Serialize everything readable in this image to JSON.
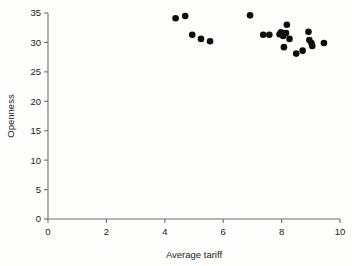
{
  "chart_data": {
    "type": "scatter",
    "title": "",
    "xlabel": "Average tariff",
    "ylabel": "Openness",
    "xlim": [
      0,
      10
    ],
    "ylim": [
      0,
      35
    ],
    "xticks": [
      0,
      2,
      4,
      6,
      8,
      10
    ],
    "yticks": [
      0,
      5,
      10,
      15,
      20,
      25,
      30,
      35
    ],
    "grid": false,
    "legend": null,
    "marker": "filled-circle",
    "marker_color": "#0d0d0d",
    "axis_color": "#6e6e6e",
    "background_color": "#fdfdfb",
    "series": [
      {
        "name": "countries",
        "points": [
          {
            "x": 4.37,
            "y": 34.1
          },
          {
            "x": 4.7,
            "y": 34.5
          },
          {
            "x": 4.94,
            "y": 31.3
          },
          {
            "x": 5.24,
            "y": 30.6
          },
          {
            "x": 5.55,
            "y": 30.2
          },
          {
            "x": 6.92,
            "y": 34.6
          },
          {
            "x": 7.37,
            "y": 31.3
          },
          {
            "x": 7.58,
            "y": 31.3
          },
          {
            "x": 7.93,
            "y": 31.4
          },
          {
            "x": 7.98,
            "y": 31.7
          },
          {
            "x": 8.05,
            "y": 31.1
          },
          {
            "x": 8.08,
            "y": 29.2
          },
          {
            "x": 8.18,
            "y": 33.0
          },
          {
            "x": 8.15,
            "y": 31.6
          },
          {
            "x": 8.27,
            "y": 30.6
          },
          {
            "x": 8.5,
            "y": 28.1
          },
          {
            "x": 8.72,
            "y": 28.6
          },
          {
            "x": 8.92,
            "y": 31.8
          },
          {
            "x": 8.95,
            "y": 30.4
          },
          {
            "x": 9.02,
            "y": 29.9
          },
          {
            "x": 9.05,
            "y": 29.4
          },
          {
            "x": 9.45,
            "y": 29.9
          }
        ]
      }
    ]
  },
  "axes": {
    "x_tick_labels": [
      "0",
      "2",
      "4",
      "6",
      "8",
      "10"
    ],
    "y_tick_labels": [
      "0",
      "5",
      "10",
      "15",
      "20",
      "25",
      "30",
      "35"
    ],
    "x_title": "Average tariff",
    "y_title": "Openness"
  }
}
